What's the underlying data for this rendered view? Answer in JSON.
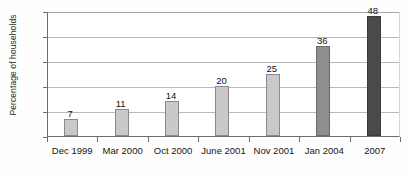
{
  "chart_data": {
    "type": "bar",
    "title": "",
    "xlabel": "",
    "ylabel": "Percentage of households",
    "categories": [
      "Dec 1999",
      "Mar 2000",
      "Oct 2000",
      "June 2001",
      "Nov 2001",
      "Jan 2004",
      "2007"
    ],
    "values": [
      7,
      11,
      14,
      20,
      25,
      36,
      48
    ],
    "value_labels": [
      "7",
      "11",
      "14",
      "20",
      "25",
      "36",
      "48"
    ],
    "ylim": [
      0,
      50
    ],
    "yticks": [
      0,
      10,
      20,
      30,
      40,
      50
    ],
    "ytick_labels": [
      "0",
      "10",
      "20",
      "30",
      "40",
      "50"
    ],
    "grid": "horizontal",
    "legend": "none",
    "bar_shades": [
      "light",
      "light",
      "light",
      "light",
      "light",
      "medium",
      "dark"
    ],
    "colors": {
      "light": "#c9c9c9",
      "medium": "#8f8f8f",
      "dark": "#4a4a4a",
      "axis": "#6d6d6d",
      "gridline": "#b9b9b9",
      "text": "#1a1a1a",
      "background": "#ffffff"
    }
  }
}
